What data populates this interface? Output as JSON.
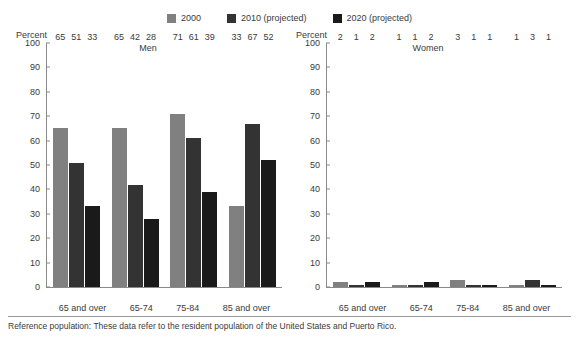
{
  "legend": {
    "items": [
      {
        "label": "2000",
        "color": "#808080"
      },
      {
        "label": "2010 (projected)",
        "color": "#333333"
      },
      {
        "label": "2020 (projected)",
        "color": "#1a1a1a"
      }
    ]
  },
  "panels": {
    "men": {
      "title": "Men",
      "axis_title": "Percent"
    },
    "women": {
      "title": "Women",
      "axis_title": "Percent"
    }
  },
  "footnote": "Reference population: These data refer to the resident population of the United States and Puerto Rico.",
  "chart_data": {
    "type": "bar",
    "title": "",
    "xlabel": "",
    "ylabel": "Percent",
    "ylim": [
      0,
      100
    ],
    "yticks": [
      0,
      10,
      20,
      30,
      40,
      50,
      60,
      70,
      80,
      90,
      100
    ],
    "grid": false,
    "legend_position": "top-center",
    "categories": [
      "65 and over",
      "65-74",
      "75-84",
      "85 and over"
    ],
    "panels": [
      {
        "name": "Men",
        "series": [
          {
            "name": "2000",
            "values": [
              65,
              65,
              71,
              33
            ]
          },
          {
            "name": "2010 (projected)",
            "values": [
              51,
              42,
              61,
              67
            ]
          },
          {
            "name": "2020 (projected)",
            "values": [
              33,
              28,
              39,
              52
            ]
          }
        ]
      },
      {
        "name": "Women",
        "series": [
          {
            "name": "2000",
            "values": [
              2,
              1,
              3,
              1
            ]
          },
          {
            "name": "2010 (projected)",
            "values": [
              1,
              1,
              1,
              3
            ]
          },
          {
            "name": "2020 (projected)",
            "values": [
              2,
              2,
              1,
              1
            ]
          }
        ]
      }
    ]
  }
}
